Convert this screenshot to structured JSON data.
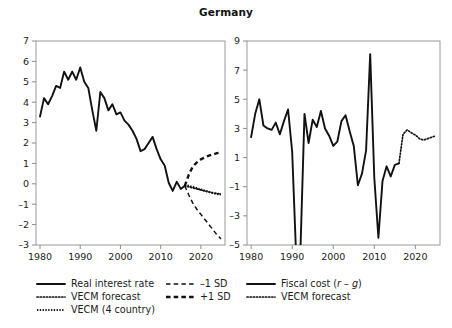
{
  "title": "Germany",
  "left_panel": {
    "legend": [
      {
        "label": "Real interest rate",
        "style": "solid"
      },
      {
        "label": "VECM forecast",
        "style": "dotted"
      },
      {
        "label": "VECM (4 country)",
        "style": "dotdense"
      },
      {
        "label": "–1 SD",
        "style": "dash-thin"
      },
      {
        "label": "+1 SD",
        "style": "dash-bold"
      }
    ]
  },
  "right_panel": {
    "legend": [
      {
        "label": "Fiscal cost (r – g)",
        "style": "solid"
      },
      {
        "label": "VECM forecast",
        "style": "dotted"
      }
    ]
  },
  "chart_data": [
    {
      "type": "line",
      "panel": "left",
      "title": "Germany",
      "xlabel": "",
      "ylabel": "",
      "xlim": [
        1979,
        2026
      ],
      "ylim": [
        -3,
        7
      ],
      "xticks": [
        1980,
        1990,
        2000,
        2010,
        2020
      ],
      "yticks": [
        -3,
        -2,
        -1,
        0,
        1,
        2,
        3,
        4,
        5,
        6,
        7
      ],
      "grid": false,
      "legend_position": "below",
      "series": [
        {
          "name": "Real interest rate",
          "style": "solid",
          "x": [
            1980,
            1981,
            1982,
            1983,
            1984,
            1985,
            1986,
            1987,
            1988,
            1989,
            1990,
            1991,
            1992,
            1993,
            1994,
            1995,
            1996,
            1997,
            1998,
            1999,
            2000,
            2001,
            2002,
            2003,
            2004,
            2005,
            2006,
            2007,
            2008,
            2009,
            2010,
            2011,
            2012,
            2013,
            2014,
            2015,
            2016
          ],
          "y": [
            3.3,
            4.2,
            3.9,
            4.3,
            4.8,
            4.7,
            5.5,
            5.1,
            5.5,
            5.1,
            5.7,
            5.0,
            4.7,
            3.6,
            2.6,
            4.5,
            4.2,
            3.6,
            3.9,
            3.4,
            3.5,
            3.1,
            2.9,
            2.6,
            2.2,
            1.6,
            1.7,
            2.0,
            2.3,
            1.7,
            1.2,
            0.9,
            0.05,
            -0.35,
            0.1,
            -0.25,
            -0.1
          ]
        },
        {
          "name": "VECM forecast",
          "style": "dotted",
          "x": [
            2016,
            2017,
            2018,
            2019,
            2020,
            2021,
            2022,
            2023,
            2024,
            2025
          ],
          "y": [
            -0.1,
            -0.15,
            -0.2,
            -0.25,
            -0.3,
            -0.35,
            -0.4,
            -0.45,
            -0.48,
            -0.5
          ]
        },
        {
          "name": "VECM (4 country)",
          "style": "dotdense",
          "x": [
            2016,
            2017,
            2018,
            2019,
            2020,
            2021,
            2022,
            2023,
            2024,
            2025
          ],
          "y": [
            -0.05,
            -0.1,
            -0.15,
            -0.22,
            -0.28,
            -0.34,
            -0.4,
            -0.45,
            -0.5,
            -0.52
          ]
        },
        {
          "name": "–1 SD",
          "style": "dash-thin",
          "x": [
            2016,
            2017,
            2018,
            2019,
            2020,
            2021,
            2022,
            2023,
            2024,
            2025
          ],
          "y": [
            -0.1,
            -0.55,
            -0.95,
            -1.25,
            -1.5,
            -1.75,
            -2.0,
            -2.25,
            -2.5,
            -2.7
          ]
        },
        {
          "name": "+1 SD",
          "style": "dash-bold",
          "x": [
            2016,
            2017,
            2018,
            2019,
            2020,
            2021,
            2022,
            2023,
            2024,
            2025
          ],
          "y": [
            -0.1,
            0.45,
            0.85,
            1.05,
            1.2,
            1.3,
            1.38,
            1.44,
            1.5,
            1.55
          ]
        }
      ]
    },
    {
      "type": "line",
      "panel": "right",
      "title": "Germany",
      "xlabel": "",
      "ylabel": "",
      "xlim": [
        1979,
        2026
      ],
      "ylim": [
        -5,
        9
      ],
      "xticks": [
        1980,
        1990,
        2000,
        2010,
        2020
      ],
      "yticks": [
        -5,
        -3,
        -1,
        1,
        3,
        5,
        7,
        9
      ],
      "grid": false,
      "legend_position": "below",
      "series": [
        {
          "name": "Fiscal cost (r – g)",
          "style": "solid",
          "x": [
            1980,
            1981,
            1982,
            1983,
            1984,
            1985,
            1986,
            1987,
            1988,
            1989,
            1990,
            1991,
            1992,
            1993,
            1994,
            1995,
            1996,
            1997,
            1998,
            1999,
            2000,
            2001,
            2002,
            2003,
            2004,
            2005,
            2006,
            2007,
            2008,
            2009,
            2010,
            2011,
            2012,
            2013,
            2014,
            2015,
            2016
          ],
          "y": [
            2.4,
            4.0,
            5.0,
            3.2,
            3.0,
            2.9,
            3.4,
            2.6,
            3.5,
            4.3,
            1.4,
            -6.0,
            -5.5,
            4.0,
            2.0,
            3.6,
            3.1,
            4.2,
            3.0,
            2.5,
            1.8,
            2.1,
            3.5,
            3.9,
            2.8,
            1.8,
            -0.9,
            -0.1,
            1.5,
            8.1,
            -0.4,
            -4.5,
            -0.6,
            0.4,
            -0.3,
            0.5,
            0.6
          ]
        },
        {
          "name": "VECM forecast",
          "style": "dotted",
          "x": [
            2016,
            2017,
            2018,
            2019,
            2020,
            2021,
            2022,
            2023,
            2024,
            2025
          ],
          "y": [
            0.6,
            2.6,
            2.9,
            2.7,
            2.55,
            2.3,
            2.2,
            2.3,
            2.4,
            2.5
          ]
        }
      ]
    }
  ]
}
